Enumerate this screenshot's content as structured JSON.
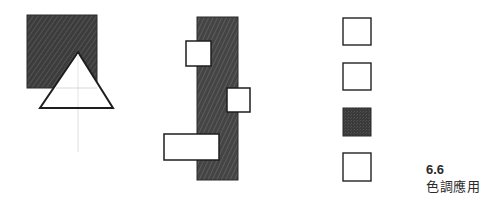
{
  "caption": {
    "number": "6.6",
    "title": "色調應用"
  },
  "colors": {
    "background": "#ffffff",
    "dark_fill": "#3a3a3a",
    "hatch": "#5a5a5a",
    "outline": "#222222",
    "guide": "#d6d6d6"
  },
  "figures": [
    {
      "name": "square-with-triangle",
      "shapes": [
        "dark-hatched-square",
        "white-triangle",
        "guide-line"
      ]
    },
    {
      "name": "vertical-strip-with-boxes",
      "shapes": [
        "dark-hatched-strip",
        "white-box-top",
        "white-box-middle",
        "white-box-bottom"
      ]
    },
    {
      "name": "tone-squares-column",
      "shapes": [
        "white-square",
        "white-square",
        "dark-square",
        "white-square"
      ]
    }
  ]
}
